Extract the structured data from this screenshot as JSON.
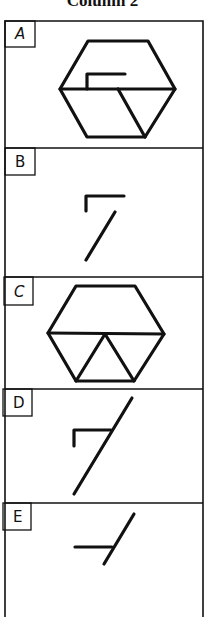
{
  "title": "Column 2",
  "colors": {
    "ink": "#111111",
    "background": "#ffffff"
  },
  "frame": {
    "left": 5,
    "right": 203,
    "top": 21,
    "bottom": 617
  },
  "panels": [
    {
      "label": "A",
      "top": 21,
      "bottom": 148,
      "label_box": {
        "x": 5,
        "y": 21,
        "w": 30,
        "h": 26
      },
      "description": "hexagon with horizontal midline, inner L-shape above midline, diagonal in lower half",
      "strokes": [
        {
          "type": "polygon",
          "points": [
            [
              88,
              41
            ],
            [
              148,
              41
            ],
            [
              175,
              89
            ],
            [
              145,
              137
            ],
            [
              87,
              137
            ],
            [
              60,
              89
            ]
          ]
        },
        {
          "type": "line",
          "points": [
            [
              60,
              89
            ],
            [
              175,
              89
            ]
          ]
        },
        {
          "type": "polyline",
          "points": [
            [
              87,
              89
            ],
            [
              87,
              74
            ],
            [
              125,
              74
            ]
          ]
        },
        {
          "type": "line",
          "points": [
            [
              118,
              89
            ],
            [
              145,
              137
            ]
          ]
        }
      ]
    },
    {
      "label": "B",
      "top": 148,
      "bottom": 277,
      "label_box": {
        "x": 5,
        "y": 148,
        "w": 30,
        "h": 27
      },
      "description": "L-shape with separate diagonal below",
      "strokes": [
        {
          "type": "polyline",
          "points": [
            [
              86,
              211
            ],
            [
              86,
              196
            ],
            [
              124,
              196
            ]
          ]
        },
        {
          "type": "line",
          "points": [
            [
              115,
              212
            ],
            [
              86,
              260
            ]
          ]
        }
      ]
    },
    {
      "label": "C",
      "top": 277,
      "bottom": 389,
      "label_box": {
        "x": 4,
        "y": 277,
        "w": 29,
        "h": 28
      },
      "description": "hexagon with horizontal midline and inverted V forming triangles in lower half",
      "strokes": [
        {
          "type": "polygon",
          "points": [
            [
              76,
              286
            ],
            [
              135,
              286
            ],
            [
              164,
              334
            ],
            [
              134,
              381
            ],
            [
              76,
              381
            ],
            [
              48,
              333
            ]
          ]
        },
        {
          "type": "line",
          "points": [
            [
              48,
              333
            ],
            [
              164,
              334
            ]
          ]
        },
        {
          "type": "polyline",
          "points": [
            [
              76,
              381
            ],
            [
              105,
              334
            ],
            [
              134,
              381
            ]
          ]
        }
      ]
    },
    {
      "label": "D",
      "top": 389,
      "bottom": 503,
      "label_box": {
        "x": 3,
        "y": 389,
        "w": 29,
        "h": 27
      },
      "description": "L-shape crossed by long diagonal",
      "strokes": [
        {
          "type": "polyline",
          "points": [
            [
              74,
              446
            ],
            [
              74,
              430
            ],
            [
              111,
              430
            ]
          ]
        },
        {
          "type": "line",
          "points": [
            [
              132,
              398
            ],
            [
              74,
              494
            ]
          ]
        }
      ]
    },
    {
      "label": "E",
      "top": 503,
      "bottom": 617,
      "label_box": {
        "x": 3,
        "y": 503,
        "w": 28,
        "h": 27
      },
      "description": "horizontal segment meeting short diagonal",
      "strokes": [
        {
          "type": "line",
          "points": [
            [
              75,
              547
            ],
            [
              112,
              547
            ]
          ]
        },
        {
          "type": "line",
          "points": [
            [
              134,
              514
            ],
            [
              104,
              564
            ]
          ]
        }
      ]
    }
  ]
}
